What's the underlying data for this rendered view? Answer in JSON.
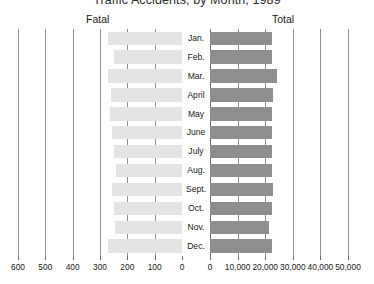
{
  "chart_data": {
    "type": "bar",
    "title": "Traffic Accidents, by Month, 1989",
    "orientation": "horizontal",
    "layout": "bidirectional-paired-panels",
    "grid": true,
    "legend_position": "panel-headers",
    "categories": [
      "Jan.",
      "Feb.",
      "Mar.",
      "April",
      "May",
      "June",
      "July",
      "Aug.",
      "Sept.",
      "Oct.",
      "Nov.",
      "Dec."
    ],
    "series": [
      {
        "name": "Fatal",
        "side": "left",
        "direction": "right-to-left",
        "color": "#e4e4e4",
        "axis_label": "Fatal",
        "xlim": [
          0,
          600
        ],
        "ticks": [
          600,
          500,
          400,
          300,
          200,
          100,
          0
        ],
        "tick_labels": [
          "600",
          "500",
          "400",
          "300",
          "200",
          "100",
          "0"
        ],
        "values": [
          270,
          250,
          270,
          260,
          265,
          255,
          250,
          240,
          255,
          250,
          245,
          270
        ]
      },
      {
        "name": "Total",
        "side": "right",
        "direction": "left-to-right",
        "color": "#8e8e8e",
        "axis_label": "Total",
        "xlim": [
          0,
          50000
        ],
        "ticks": [
          0,
          10000,
          20000,
          30000,
          40000,
          50000
        ],
        "tick_labels": [
          "0",
          "10,000",
          "20,000",
          "30,000",
          "40,000",
          "50,000"
        ],
        "values": [
          22300,
          22300,
          24400,
          22800,
          22400,
          22400,
          22300,
          22400,
          22800,
          22400,
          21500,
          22400
        ]
      }
    ]
  }
}
